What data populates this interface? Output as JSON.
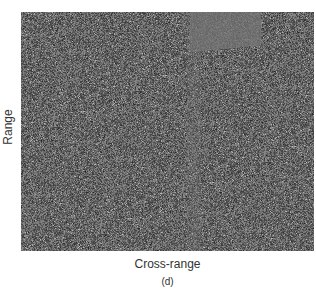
{
  "figure": {
    "xlabel": "Cross-range",
    "ylabel": "Range",
    "caption": "(d)"
  },
  "image": {
    "description": "SAR speckle image (grayscale noise field)",
    "base_color": "#6b6b6b",
    "light_speckle": "#9a9a9a",
    "dark_speckle": "#4a4a4a",
    "smooth_region_color": "#747474"
  }
}
